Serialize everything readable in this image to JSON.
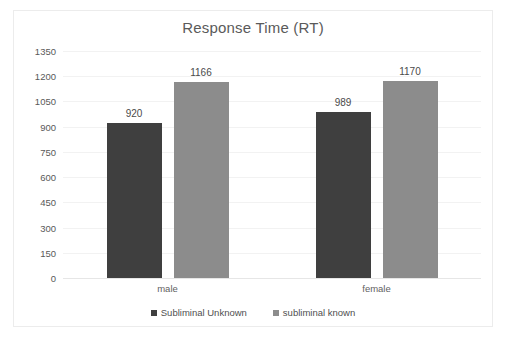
{
  "chart_data": {
    "type": "bar",
    "title": "Response Time (RT)",
    "xlabel": "",
    "ylabel": "",
    "categories": [
      "male",
      "female"
    ],
    "series": [
      {
        "name": "Subliminal Unknown",
        "color": "#3f3f3f",
        "values": [
          920,
          989
        ]
      },
      {
        "name": "subliminal known",
        "color": "#8c8c8c",
        "values": [
          1166,
          1170
        ]
      }
    ],
    "ylim": [
      0,
      1350
    ],
    "ytick_step": 150,
    "yticks": [
      1350,
      1200,
      1050,
      900,
      750,
      600,
      450,
      300,
      150,
      0
    ],
    "ytick_labels": [
      "1350",
      "1200",
      "1050",
      "900",
      "750",
      "600",
      "450",
      "300",
      "150",
      "0"
    ],
    "data_labels": [
      [
        "920",
        "1166"
      ],
      [
        "989",
        "1170"
      ]
    ],
    "grid": true,
    "legend_position": "bottom",
    "plot_background": "#ffffff",
    "gridline_color": "#f2f2f2",
    "frame_border_color": "#ececec"
  }
}
